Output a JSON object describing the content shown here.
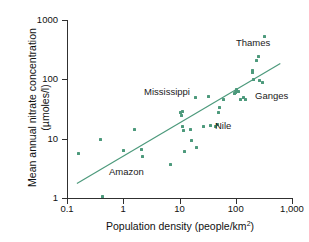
{
  "chart_data": {
    "type": "scatter",
    "title": "",
    "xlabel": "Population density (people/km2)",
    "xlabel_base": "Population density (people/km",
    "xlabel_sup": "2",
    "xlabel_tail": ")",
    "ylabel_line1": "Mean annual nitrate concentration",
    "ylabel_line2": "(µmoles/l)",
    "xscale": "log",
    "yscale": "log",
    "xlim": [
      0.1,
      1000
    ],
    "ylim": [
      1,
      1000
    ],
    "grid": false,
    "legend": "none",
    "marker_color": "#4d9a7c",
    "line_color": "#4d9a7c",
    "axis_color": "#303030",
    "xticks": [
      {
        "value": 0.1,
        "label": "0.1"
      },
      {
        "value": 1,
        "label": "1"
      },
      {
        "value": 10,
        "label": "10"
      },
      {
        "value": 100,
        "label": "100"
      },
      {
        "value": 1000,
        "label": "1,000"
      }
    ],
    "yticks": [
      {
        "value": 1,
        "label": "1"
      },
      {
        "value": 10,
        "label": "10"
      },
      {
        "value": 100,
        "label": "100"
      },
      {
        "value": 1000,
        "label": "1000"
      }
    ],
    "points": [
      {
        "x": 0.16,
        "y": 5.6
      },
      {
        "x": 0.4,
        "y": 9.6
      },
      {
        "x": 0.42,
        "y": 1.05
      },
      {
        "x": 1.0,
        "y": 6.2
      },
      {
        "x": 1.6,
        "y": 14.5
      },
      {
        "x": 2.1,
        "y": 6.6
      },
      {
        "x": 2.2,
        "y": 5.0
      },
      {
        "x": 7.0,
        "y": 3.7
      },
      {
        "x": 10.5,
        "y": 27.5
      },
      {
        "x": 11.0,
        "y": 25.0
      },
      {
        "x": 11.5,
        "y": 29.0
      },
      {
        "x": 11.5,
        "y": 16.0
      },
      {
        "x": 12.0,
        "y": 13.5
      },
      {
        "x": 12.5,
        "y": 6.0
      },
      {
        "x": 16.0,
        "y": 14.5
      },
      {
        "x": 16.5,
        "y": 9.3
      },
      {
        "x": 19.0,
        "y": 49.0
      },
      {
        "x": 20.0,
        "y": 7.0
      },
      {
        "x": 27.0,
        "y": 16.0
      },
      {
        "x": 33.0,
        "y": 52.0
      },
      {
        "x": 36.0,
        "y": 16.5
      },
      {
        "x": 44.0,
        "y": 16.3
      },
      {
        "x": 48.0,
        "y": 17.5
      },
      {
        "x": 50.0,
        "y": 28.0
      },
      {
        "x": 52.0,
        "y": 33.5
      },
      {
        "x": 60.0,
        "y": 45.0
      },
      {
        "x": 95.0,
        "y": 58.0
      },
      {
        "x": 100.0,
        "y": 61.0
      },
      {
        "x": 102.0,
        "y": 66.0
      },
      {
        "x": 105.0,
        "y": 68.0
      },
      {
        "x": 110.0,
        "y": 63.0
      },
      {
        "x": 120.0,
        "y": 46.0
      },
      {
        "x": 140.0,
        "y": 50.0
      },
      {
        "x": 150.0,
        "y": 45.0
      },
      {
        "x": 195.0,
        "y": 140.0
      },
      {
        "x": 200.0,
        "y": 130.0
      },
      {
        "x": 205.0,
        "y": 100.0
      },
      {
        "x": 230.0,
        "y": 210.0
      },
      {
        "x": 250.0,
        "y": 240.0
      },
      {
        "x": 260.0,
        "y": 95.0
      },
      {
        "x": 300.0,
        "y": 88.0
      },
      {
        "x": 330.0,
        "y": 520.0
      }
    ],
    "trendline": {
      "x_start": 0.15,
      "y_start": 1.75,
      "x_end": 620.0,
      "y_end": 185.0
    },
    "annotations": [
      {
        "text": "Thames",
        "x": 236,
        "y": 37
      },
      {
        "text": "Mississippi",
        "x": 144,
        "y": 86
      },
      {
        "text": "Ganges",
        "x": 255,
        "y": 90
      },
      {
        "text": "Nile",
        "x": 215,
        "y": 120
      },
      {
        "text": "Amazon",
        "x": 109,
        "y": 166
      }
    ]
  }
}
